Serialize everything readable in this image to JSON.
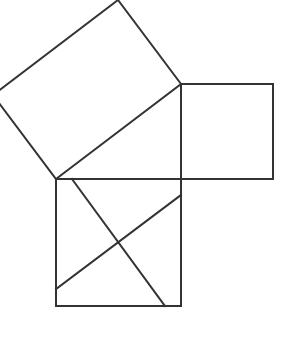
{
  "diagram": {
    "stroke_color": "#333333",
    "background": "#ffffff",
    "shapes": {
      "hypotenuse_square": [
        [
          56,
          179
        ],
        [
          181,
          84
        ],
        [
          118,
          0
        ],
        [
          -7,
          95
        ]
      ],
      "right_square": [
        [
          181,
          84
        ],
        [
          273,
          84
        ],
        [
          273,
          179
        ],
        [
          181,
          179
        ]
      ],
      "bottom_square": [
        [
          56,
          179
        ],
        [
          181,
          179
        ],
        [
          181,
          306
        ],
        [
          56,
          306
        ]
      ]
    },
    "cut_lines": [
      {
        "from": [
          72,
          179
        ],
        "to": [
          165,
          306
        ]
      },
      {
        "from": [
          56,
          289
        ],
        "to": [
          181,
          195
        ]
      }
    ]
  }
}
